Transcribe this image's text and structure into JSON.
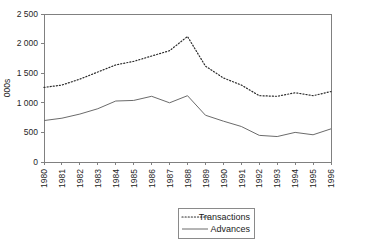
{
  "chart_data": {
    "type": "line",
    "title": "",
    "xlabel": "",
    "ylabel": "000s",
    "ylim": [
      0,
      2500
    ],
    "yticks": [
      0,
      500,
      1000,
      1500,
      2000,
      2500
    ],
    "ytick_labels": [
      "0",
      "500",
      "1 000",
      "1 500",
      "2 000",
      "2 500"
    ],
    "grid": false,
    "legend_position": "bottom-right",
    "categories": [
      "1980",
      "1981",
      "1982",
      "1983",
      "1984",
      "1985",
      "1986",
      "1987",
      "1988",
      "1989",
      "1990",
      "1991",
      "1992",
      "1993",
      "1994",
      "1995",
      "1996"
    ],
    "series": [
      {
        "name": "Transactions",
        "style": "dotted",
        "color": "#2b2b2b",
        "values": [
          1260,
          1300,
          1400,
          1520,
          1640,
          1700,
          1790,
          1880,
          2120,
          1620,
          1420,
          1300,
          1120,
          1110,
          1170,
          1120,
          1190
        ]
      },
      {
        "name": "Advances",
        "style": "solid",
        "color": "#6b6b6b",
        "values": [
          700,
          740,
          810,
          900,
          1030,
          1040,
          1110,
          1000,
          1120,
          790,
          690,
          600,
          450,
          430,
          500,
          460,
          560
        ]
      }
    ]
  },
  "legend": {
    "entries": [
      {
        "label": "Transactions",
        "style": "dotted"
      },
      {
        "label": "Advances",
        "style": "solid"
      }
    ]
  }
}
